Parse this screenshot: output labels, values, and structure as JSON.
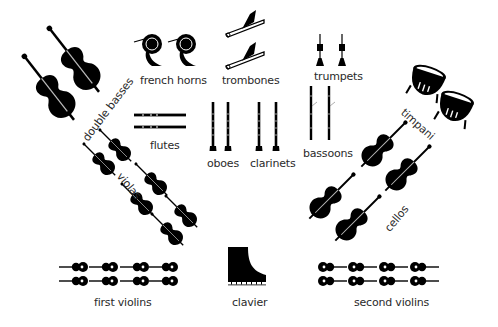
{
  "diagram": {
    "type": "orchestra-seating-chart",
    "sections": [
      {
        "id": "double_basses",
        "label": "double basses",
        "count": 2
      },
      {
        "id": "french_horns",
        "label": "french horns",
        "count": 2
      },
      {
        "id": "trombones",
        "label": "trombones",
        "count": 2
      },
      {
        "id": "trumpets",
        "label": "trumpets",
        "count": 2
      },
      {
        "id": "timpani",
        "label": "timpani",
        "count": 2
      },
      {
        "id": "flutes",
        "label": "flutes",
        "count": 2
      },
      {
        "id": "oboes",
        "label": "oboes",
        "count": 2
      },
      {
        "id": "clarinets",
        "label": "clarinets",
        "count": 2
      },
      {
        "id": "bassoons",
        "label": "bassoons",
        "count": 2
      },
      {
        "id": "violas",
        "label": "violas",
        "count": 6
      },
      {
        "id": "cellos",
        "label": "cellos",
        "count": 4
      },
      {
        "id": "first_violins",
        "label": "first violins",
        "count": 8
      },
      {
        "id": "clavier",
        "label": "clavier",
        "count": 1
      },
      {
        "id": "second_violins",
        "label": "second violins",
        "count": 8
      }
    ],
    "colors": {
      "background": "#ffffff",
      "instrument": "#000000",
      "text": "#2a2a2a"
    }
  }
}
